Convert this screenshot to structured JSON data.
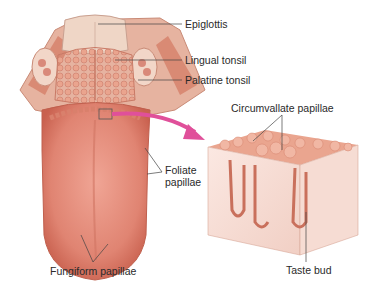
{
  "diagram": {
    "labels": {
      "epiglottis": "Epiglottis",
      "lingual_tonsil": "Lingual tonsil",
      "palatine_tonsil": "Palatine tonsil",
      "circumvallate_papillae": "Circumvallate papillae",
      "foliate_papillae_line1": "Foliate",
      "foliate_papillae_line2": "papillae",
      "fungiform_papillae": "Fungiform papillae",
      "taste_bud": "Taste bud"
    },
    "colors": {
      "tongue": "#e48a78",
      "tongue_dark": "#c9614f",
      "tonsil": "#e9a48f",
      "epiglottis": "#efd6c6",
      "tissue_block": "#f6dcd3",
      "tissue_top": "#eaa58f",
      "arrow": "#e0509a",
      "leader_line": "#444444"
    }
  }
}
